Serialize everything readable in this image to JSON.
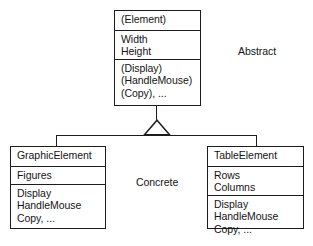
{
  "diagram": {
    "type": "uml-class-hierarchy",
    "relationship": "generalization",
    "classes": [
      {
        "id": "element",
        "name": "(Element)",
        "stereotype": "abstract",
        "attributes": [
          "Width",
          "Height"
        ],
        "operations": [
          "(Display)",
          "(HandleMouse)",
          "(Copy), ..."
        ]
      },
      {
        "id": "graphic-element",
        "name": "GraphicElement",
        "stereotype": "concrete",
        "attributes": [
          "Figures"
        ],
        "operations": [
          "Display",
          "HandleMouse",
          "Copy, ..."
        ]
      },
      {
        "id": "table-element",
        "name": "TableElement",
        "stereotype": "concrete",
        "attributes": [
          "Rows",
          "Columns"
        ],
        "operations": [
          "Display",
          "HandleMouse",
          "Copy, ..."
        ]
      }
    ],
    "annotations": [
      {
        "id": "abstract",
        "text": "Abstract"
      },
      {
        "id": "concrete",
        "text": "Concrete"
      }
    ],
    "colors": {
      "line": "#1c1c1c",
      "text": "#141414",
      "background": "#ffffff"
    }
  }
}
